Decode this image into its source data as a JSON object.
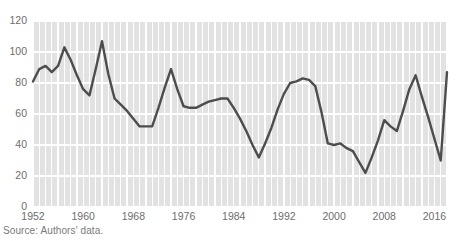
{
  "source_note": "Source: Authors' data.",
  "colors": {
    "plot_background": "#e2e2e2",
    "gridline": "#ffffff",
    "line": "#4d4d4d",
    "tick_text": "#6d6d6d",
    "source_text": "#7a7a7a"
  },
  "chart_data": {
    "type": "line",
    "title": "",
    "subtitle": "",
    "xlabel": "",
    "ylabel": "",
    "xlim": [
      1952,
      2018
    ],
    "ylim": [
      0,
      120
    ],
    "yticks": [
      0,
      20,
      40,
      60,
      80,
      100,
      120
    ],
    "xticks": [
      1952,
      1960,
      1968,
      1976,
      1984,
      1992,
      2000,
      2008,
      2016
    ],
    "grid": "both",
    "grid_color": "#ffffff",
    "legend": "none",
    "annotations": [],
    "x": [
      1952,
      1953,
      1954,
      1955,
      1956,
      1957,
      1958,
      1959,
      1960,
      1961,
      1962,
      1963,
      1964,
      1965,
      1966,
      1967,
      1968,
      1969,
      1970,
      1971,
      1972,
      1973,
      1974,
      1975,
      1976,
      1977,
      1978,
      1979,
      1980,
      1981,
      1982,
      1983,
      1984,
      1985,
      1986,
      1987,
      1988,
      1989,
      1990,
      1991,
      1992,
      1993,
      1994,
      1995,
      1996,
      1997,
      1998,
      1999,
      2000,
      2001,
      2002,
      2003,
      2004,
      2005,
      2006,
      2007,
      2008,
      2009,
      2010,
      2011,
      2012,
      2013,
      2014,
      2015,
      2016,
      2017,
      2018
    ],
    "values": [
      81,
      89,
      91,
      87,
      91,
      103,
      95,
      85,
      76,
      72,
      89,
      107,
      86,
      70,
      66,
      62,
      57,
      52,
      52,
      52,
      64,
      77,
      89,
      76,
      65,
      64,
      64,
      66,
      68,
      69,
      70,
      70,
      64,
      57,
      49,
      40,
      32,
      41,
      51,
      63,
      73,
      80,
      81,
      83,
      82,
      78,
      61,
      41,
      40,
      41,
      38,
      36,
      29,
      22,
      32,
      43,
      56,
      52,
      49,
      62,
      76,
      85,
      71,
      58,
      44,
      30,
      87
    ],
    "series": [
      {
        "name": "series-1",
        "values": [
          81,
          89,
          91,
          87,
          91,
          103,
          95,
          85,
          76,
          72,
          89,
          107,
          86,
          70,
          66,
          62,
          57,
          52,
          52,
          52,
          64,
          77,
          89,
          76,
          65,
          64,
          64,
          66,
          68,
          69,
          70,
          70,
          64,
          57,
          49,
          40,
          32,
          41,
          51,
          63,
          73,
          80,
          81,
          83,
          82,
          78,
          61,
          41,
          40,
          41,
          38,
          36,
          29,
          22,
          32,
          43,
          56,
          52,
          49,
          62,
          76,
          85,
          71,
          58,
          44,
          30,
          87
        ]
      }
    ]
  },
  "geometry": {
    "plot_left": 33,
    "plot_right": 447,
    "plot_top": 21,
    "plot_bottom": 207,
    "line_width": 2.4
  }
}
